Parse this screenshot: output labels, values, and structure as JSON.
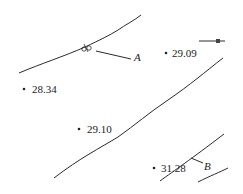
{
  "map": {
    "type": "contour-map",
    "line_color": "#2a2a2a",
    "elevation_points": [
      {
        "label": "29.09",
        "x": 166,
        "y": 53
      },
      {
        "label": "28.34",
        "x": 24,
        "y": 89
      },
      {
        "label": "29.10",
        "x": 79,
        "y": 129
      },
      {
        "label": "31.28",
        "x": 154,
        "y": 168
      }
    ],
    "markers": [
      {
        "label": "A"
      },
      {
        "label": "B"
      }
    ]
  }
}
